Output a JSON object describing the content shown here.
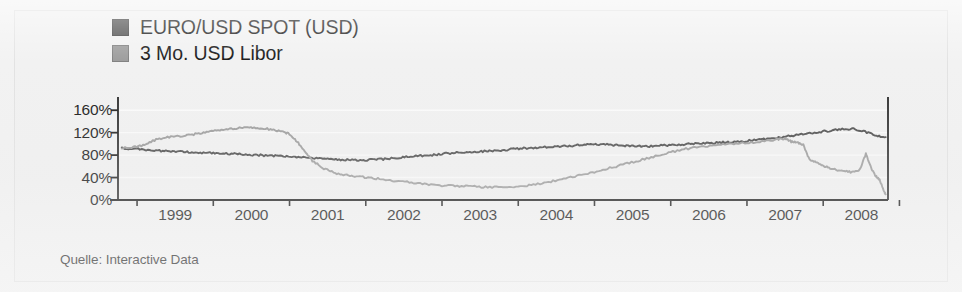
{
  "figure": {
    "source_note": "Quelle: Interactive Data",
    "background_color": "#f1f1f1",
    "frame_color": "#e2e2e2"
  },
  "legend": {
    "position": "top-left",
    "items": [
      {
        "label": "EURO/USD SPOT (USD)",
        "color": "#4a4a4a",
        "swatch_name": "legend-swatch-eurusd"
      },
      {
        "label": "3 Mo. USD Libor",
        "color": "#9b9b9b",
        "swatch_name": "legend-swatch-libor"
      }
    ]
  },
  "axis": {
    "y_ticks": [
      "160%",
      "120%",
      "80%",
      "40%",
      "0%"
    ],
    "x_ticks": [
      "1999",
      "2000",
      "2001",
      "2002",
      "2003",
      "2004",
      "2005",
      "2006",
      "2007",
      "2008"
    ],
    "axis_color": "#1a1a1a",
    "gridline_color": "#fbfbfb"
  },
  "chart_data": {
    "type": "line",
    "title": "",
    "subtitle": "",
    "xlabel": "",
    "ylabel": "",
    "xlim": [
      1998.75,
      2008.85
    ],
    "ylim": [
      0,
      180
    ],
    "y_tick_values": [
      0,
      40,
      80,
      120,
      160
    ],
    "y_tick_labels": [
      "0%",
      "40%",
      "80%",
      "120%",
      "160%"
    ],
    "x_tick_values": [
      1999,
      2000,
      2001,
      2002,
      2003,
      2004,
      2005,
      2006,
      2007,
      2008
    ],
    "x_tick_labels": [
      "1999",
      "2000",
      "2001",
      "2002",
      "2003",
      "2004",
      "2005",
      "2006",
      "2007",
      "2008"
    ],
    "grid": false,
    "legend_position": "above-plot-left",
    "note": "Indexed series, both rebased to approximately 90-95% at start of 1999.",
    "series": [
      {
        "name": "EURO/USD SPOT (USD)",
        "color": "#4a4a4a",
        "x": [
          1998.8,
          1998.95,
          1999.1,
          1999.25,
          1999.4,
          1999.55,
          1999.7,
          1999.85,
          2000.0,
          2000.15,
          2000.3,
          2000.45,
          2000.6,
          2000.75,
          2000.9,
          2001.05,
          2001.2,
          2001.35,
          2001.5,
          2001.65,
          2001.8,
          2001.95,
          2002.1,
          2002.25,
          2002.4,
          2002.55,
          2002.7,
          2002.85,
          2003.0,
          2003.15,
          2003.3,
          2003.45,
          2003.6,
          2003.75,
          2003.9,
          2004.05,
          2004.2,
          2004.35,
          2004.5,
          2004.65,
          2004.8,
          2004.95,
          2005.1,
          2005.25,
          2005.4,
          2005.55,
          2005.7,
          2005.85,
          2006.0,
          2006.15,
          2006.3,
          2006.45,
          2006.6,
          2006.75,
          2006.9,
          2007.05,
          2007.2,
          2007.35,
          2007.5,
          2007.65,
          2007.8,
          2007.95,
          2008.1,
          2008.25,
          2008.4,
          2008.55,
          2008.7,
          2008.82
        ],
        "y": [
          92,
          91,
          90,
          88,
          87,
          86,
          85,
          84,
          84,
          83,
          82,
          81,
          80,
          79,
          78,
          77,
          76,
          74,
          73,
          72,
          71,
          71,
          72,
          73,
          75,
          77,
          79,
          80,
          82,
          84,
          85,
          86,
          87,
          88,
          90,
          92,
          93,
          94,
          95,
          96,
          98,
          100,
          99,
          98,
          97,
          96,
          96,
          97,
          98,
          99,
          100,
          101,
          102,
          103,
          104,
          106,
          108,
          110,
          113,
          116,
          119,
          121,
          124,
          126,
          127,
          122,
          114,
          112
        ]
      },
      {
        "name": "3 Mo. USD Libor",
        "color": "#9b9b9b",
        "x": [
          1998.8,
          1998.95,
          1999.1,
          1999.25,
          1999.4,
          1999.55,
          1999.7,
          1999.85,
          2000.0,
          2000.15,
          2000.3,
          2000.45,
          2000.6,
          2000.75,
          2000.9,
          2001.0,
          2001.1,
          2001.2,
          2001.3,
          2001.45,
          2001.6,
          2001.75,
          2001.9,
          2002.05,
          2002.2,
          2002.4,
          2002.6,
          2002.8,
          2003.0,
          2003.2,
          2003.4,
          2003.6,
          2003.8,
          2004.0,
          2004.2,
          2004.4,
          2004.6,
          2004.8,
          2005.0,
          2005.2,
          2005.4,
          2005.6,
          2005.8,
          2006.0,
          2006.2,
          2006.4,
          2006.6,
          2006.8,
          2007.0,
          2007.2,
          2007.4,
          2007.5,
          2007.58,
          2007.66,
          2007.74,
          2007.82,
          2007.92,
          2008.02,
          2008.12,
          2008.24,
          2008.36,
          2008.48,
          2008.56,
          2008.62,
          2008.68,
          2008.74,
          2008.8,
          2008.82
        ],
        "y": [
          92,
          94,
          98,
          108,
          112,
          114,
          116,
          120,
          124,
          126,
          128,
          130,
          128,
          126,
          122,
          118,
          104,
          88,
          70,
          56,
          48,
          44,
          42,
          40,
          37,
          34,
          31,
          28,
          26,
          25,
          24,
          23,
          23,
          24,
          27,
          32,
          38,
          44,
          50,
          57,
          64,
          71,
          78,
          85,
          91,
          95,
          98,
          100,
          102,
          104,
          108,
          110,
          104,
          102,
          98,
          72,
          66,
          60,
          56,
          52,
          50,
          54,
          82,
          60,
          44,
          36,
          14,
          10
        ]
      }
    ]
  }
}
